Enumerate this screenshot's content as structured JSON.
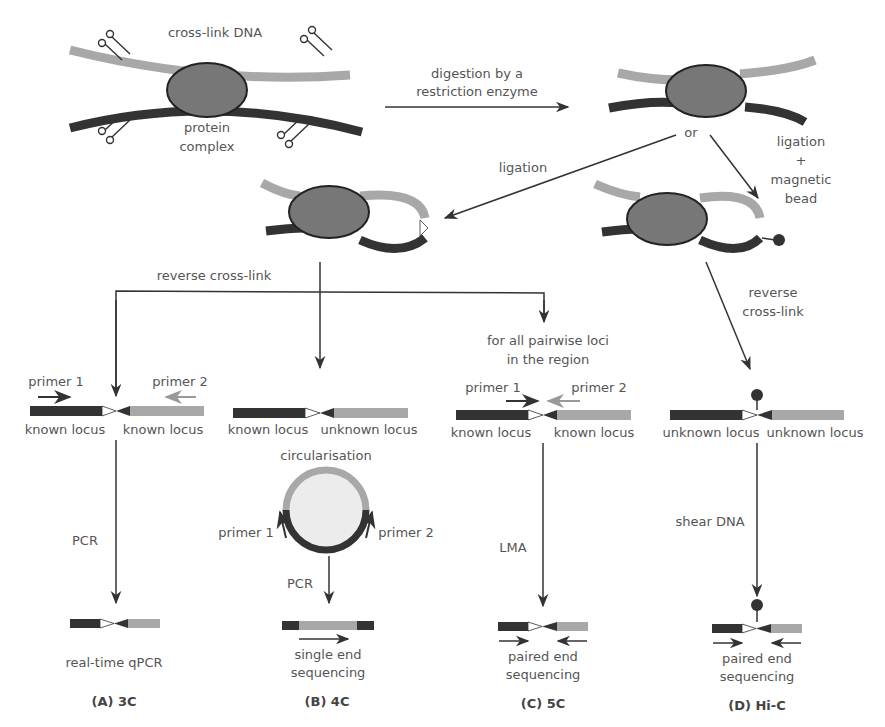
{
  "colors": {
    "dark_strand": "#333333",
    "light_strand": "#a8a8a8",
    "protein": "#777777",
    "protein_border": "#222222",
    "arrow": "#333333",
    "text": "#555555",
    "circle_fill": "#ececec"
  },
  "top": {
    "crosslink_label": "cross-link DNA",
    "protein_label_1": "protein",
    "protein_label_2": "complex",
    "digestion_label_1": "digestion by a",
    "digestion_label_2": "restriction enzyme",
    "or_label": "or",
    "ligation_label": "ligation",
    "ligation_bead_1": "ligation",
    "ligation_bead_2": "+",
    "ligation_bead_3": "magnetic",
    "ligation_bead_4": "bead"
  },
  "middle": {
    "reverse_crosslink": "reverse cross-link",
    "pairwise_1": "for all pairwise loci",
    "pairwise_2": "in the region",
    "reverse_1": "reverse",
    "reverse_2": "cross-link"
  },
  "panels": [
    {
      "id": "A",
      "primer1": "primer 1",
      "primer2": "primer 2",
      "locus_left": "known locus",
      "locus_right": "known locus",
      "step": "PCR",
      "result": "real-time qPCR",
      "label": "(A) 3C"
    },
    {
      "id": "B",
      "locus_left": "known locus",
      "locus_right": "unknown locus",
      "circ": "circularisation",
      "primer1": "primer 1",
      "primer2": "primer 2",
      "step": "PCR",
      "result_1": "single end",
      "result_2": "sequencing",
      "label": "(B) 4C"
    },
    {
      "id": "C",
      "primer1": "primer 1",
      "primer2": "primer 2",
      "locus_left": "known locus",
      "locus_right": "known locus",
      "step": "LMA",
      "result_1": "paired end",
      "result_2": "sequencing",
      "label": "(C) 5C"
    },
    {
      "id": "D",
      "locus_left": "unknown locus",
      "locus_right": "unknown locus",
      "step": "shear DNA",
      "result_1": "paired end",
      "result_2": "sequencing",
      "label": "(D) Hi-C"
    }
  ]
}
